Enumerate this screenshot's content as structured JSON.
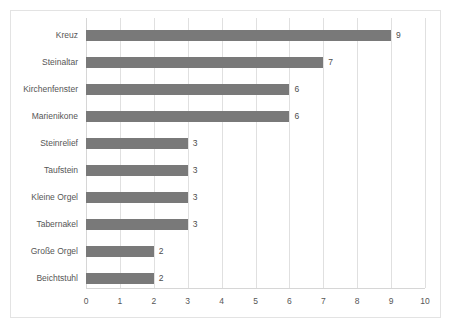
{
  "chart_data": {
    "type": "bar",
    "orientation": "horizontal",
    "title": "",
    "subtitle": "",
    "xlabel": "",
    "ylabel": "",
    "xlim": [
      0,
      10
    ],
    "xticks": [
      "0",
      "1",
      "2",
      "3",
      "4",
      "5",
      "6",
      "7",
      "8",
      "9",
      "10"
    ],
    "grid": true,
    "legend": false,
    "legend_position": "none",
    "bar_color": "#797979",
    "gridline_color": "#e0e0e0",
    "text_color": "#565656",
    "background_color": "#ffffff",
    "categories": [
      "Kreuz",
      "Steinaltar",
      "Kirchenfenster",
      "Marienikone",
      "Steinrelief",
      "Taufstein",
      "Kleine Orgel",
      "Tabernakel",
      "Große Orgel",
      "Beichtstuhl"
    ],
    "values": [
      9,
      7,
      6,
      6,
      3,
      3,
      3,
      3,
      2,
      2
    ],
    "data_labels": [
      "9",
      "7",
      "6",
      "6",
      "3",
      "3",
      "3",
      "3",
      "2",
      "2"
    ]
  }
}
